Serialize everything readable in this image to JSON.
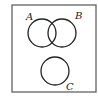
{
  "diagram": {
    "type": "venn",
    "frame": {
      "x": 12,
      "y": 5,
      "width": 84,
      "height": 87,
      "stroke": "#444444"
    },
    "sets": [
      {
        "label": "A",
        "cx": 42,
        "cy": 33,
        "r": 14,
        "label_x": 28,
        "label_y": 20
      },
      {
        "label": "B",
        "cx": 62,
        "cy": 33,
        "r": 14,
        "label_x": 75,
        "label_y": 19
      },
      {
        "label": "C",
        "cx": 55,
        "cy": 71,
        "r": 14,
        "label_x": 66,
        "label_y": 89
      }
    ],
    "relations": [
      "A and B overlap",
      "C is disjoint from A and B"
    ],
    "stroke_color": "#222222"
  }
}
